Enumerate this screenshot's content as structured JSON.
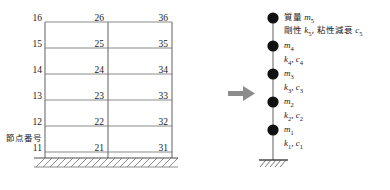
{
  "diagram": {
    "colors": {
      "beam": "#8c8c8c",
      "column": "#6e6e6e",
      "ground": "#4d4d4d",
      "mass": "#111111",
      "text": "#1a1a1a",
      "arrow": "#8c8c8c"
    }
  },
  "frame": {
    "caption": "節点番号",
    "columns": [
      {
        "id": "left",
        "nodes": [
          "16",
          "15",
          "14",
          "13",
          "12",
          "11"
        ]
      },
      {
        "id": "middle",
        "nodes": [
          "26",
          "25",
          "24",
          "23",
          "22",
          "21"
        ]
      },
      {
        "id": "right",
        "nodes": [
          "36",
          "35",
          "34",
          "33",
          "32",
          "31"
        ]
      }
    ],
    "story_count": 5,
    "node_count": 18
  },
  "arrow": {
    "name": "transform-arrow",
    "direction": "right"
  },
  "model": {
    "masses": [
      {
        "index": 5,
        "mass_label_jp": "質量",
        "mass_symbol": "m",
        "mass_sub": "5",
        "spring_label_jp": "剛性",
        "spring_symbol": "k",
        "spring_sub": "5",
        "damper_label_jp": "粘性減衰",
        "damper_symbol": "c",
        "damper_sub": "5"
      },
      {
        "index": 4,
        "mass_label_jp": "",
        "mass_symbol": "m",
        "mass_sub": "4",
        "spring_label_jp": "",
        "spring_symbol": "k",
        "spring_sub": "4",
        "damper_label_jp": "",
        "damper_symbol": "c",
        "damper_sub": "4"
      },
      {
        "index": 3,
        "mass_label_jp": "",
        "mass_symbol": "m",
        "mass_sub": "3",
        "spring_label_jp": "",
        "spring_symbol": "k",
        "spring_sub": "3",
        "damper_label_jp": "",
        "damper_symbol": "c",
        "damper_sub": "3"
      },
      {
        "index": 2,
        "mass_label_jp": "",
        "mass_symbol": "m",
        "mass_sub": "2",
        "spring_label_jp": "",
        "spring_symbol": "k",
        "spring_sub": "2",
        "damper_label_jp": "",
        "damper_symbol": "c",
        "damper_sub": "2"
      },
      {
        "index": 1,
        "mass_label_jp": "",
        "mass_symbol": "m",
        "mass_sub": "1",
        "spring_label_jp": "",
        "spring_symbol": "k",
        "spring_sub": "1",
        "damper_label_jp": "",
        "damper_symbol": "c",
        "damper_sub": "1"
      }
    ],
    "mass_text": [
      "質量 m5",
      "m4",
      "m3",
      "m2",
      "m1"
    ],
    "spring_text": [
      "剛性 k5, 粘性減衰 c5",
      "k4, c4",
      "k3, c3",
      "k2, c2",
      "k1, c1"
    ]
  }
}
